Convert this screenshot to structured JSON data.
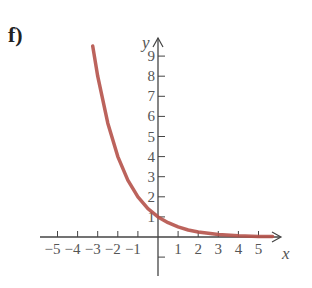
{
  "panel_label": "f)",
  "colors": {
    "curve": "#b5524a",
    "axis": "#444444",
    "text": "#555555"
  },
  "chart_data": {
    "type": "line",
    "title": "",
    "xlabel": "x",
    "ylabel": "y",
    "function": "y = (1/2)^x",
    "x_ticks": [
      -5,
      -4,
      -3,
      -2,
      -1,
      1,
      2,
      3,
      4,
      5
    ],
    "y_ticks": [
      1,
      2,
      3,
      4,
      5,
      6,
      7,
      8,
      9
    ],
    "x_tick_labels": [
      "−5",
      "−4",
      "−3",
      "−2",
      "−1",
      "1",
      "2",
      "3",
      "4",
      "5"
    ],
    "y_tick_labels": [
      "1",
      "2",
      "3",
      "4",
      "5",
      "6",
      "7",
      "8",
      "9"
    ],
    "xlim": [
      -5.5,
      6
    ],
    "ylim": [
      -2,
      10
    ],
    "grid": false,
    "series": [
      {
        "name": "curve",
        "x": [
          -3.25,
          -3,
          -2.5,
          -2,
          -1.5,
          -1,
          -0.5,
          0,
          0.5,
          1,
          1.5,
          2,
          3,
          4,
          5,
          5.7
        ],
        "values": [
          9.5,
          8,
          5.66,
          4,
          2.83,
          2,
          1.41,
          1,
          0.71,
          0.5,
          0.35,
          0.25,
          0.125,
          0.06,
          0.03,
          0.02
        ]
      }
    ]
  }
}
